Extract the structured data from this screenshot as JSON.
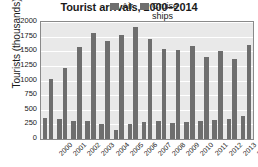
{
  "chart_data": {
    "type": "bar",
    "title": "Tourist arrivals, 2000–2014",
    "xlabel": "",
    "ylabel": "Tourists (thousands)",
    "ylim": [
      0,
      2000
    ],
    "ytick_step": 250,
    "yticks": [
      2000,
      1750,
      1500,
      1250,
      1000,
      750,
      500,
      250,
      0
    ],
    "grid": true,
    "legend_position": "top-right",
    "categories": [
      "2000",
      "2001",
      "2002",
      "2003",
      "2004",
      "2005",
      "2006",
      "2007",
      "2008",
      "2009",
      "2010",
      "2011",
      "2012",
      "2013",
      "2014"
    ],
    "series": [
      {
        "name": "Air",
        "color": "#6e6e6e",
        "values": [
          355,
          340,
          310,
          300,
          265,
          160,
          265,
          295,
          300,
          275,
          290,
          310,
          325,
          345,
          395
        ]
      },
      {
        "name": "Cruise ships",
        "color": "#6e6e6e",
        "values": [
          1025,
          1210,
          1565,
          1810,
          1680,
          1785,
          1920,
          1705,
          1545,
          1515,
          1590,
          1400,
          1505,
          1370,
          1605
        ]
      }
    ]
  },
  "legend": {
    "items": [
      {
        "label": "Air"
      },
      {
        "label": "Cruise ships"
      }
    ]
  },
  "colors": {
    "bar": "#6e6e6e",
    "plot_background": "#e9e9e9",
    "gridline": "#ffffff",
    "frame": "#8a8a8a",
    "text": "#1a1a1a",
    "page_background": "#ffffff"
  }
}
